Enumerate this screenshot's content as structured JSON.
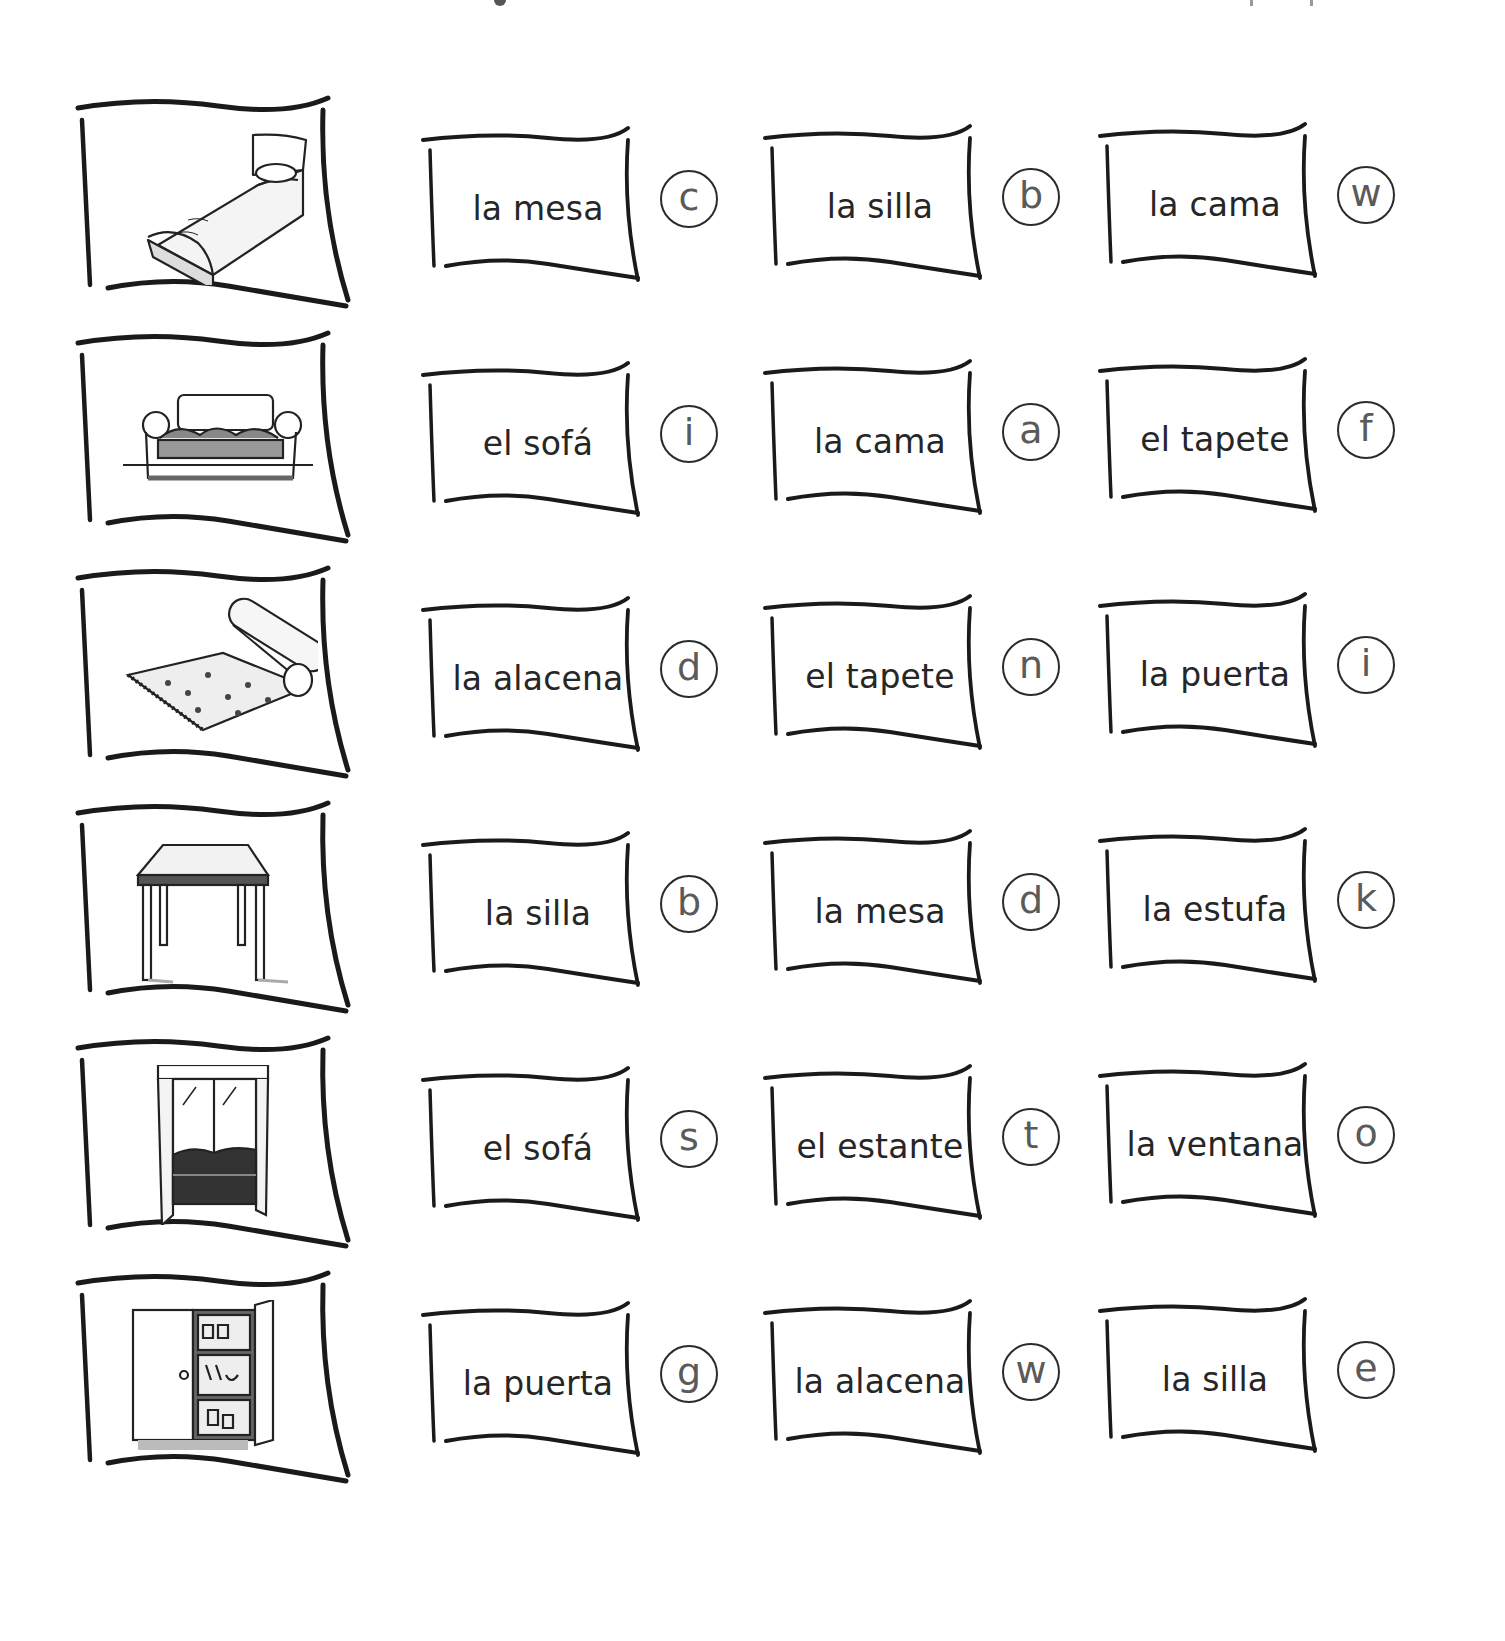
{
  "worksheet": {
    "rows": [
      {
        "picture": "bed-icon",
        "choices": [
          {
            "word": "la mesa",
            "letter": "c"
          },
          {
            "word": "la silla",
            "letter": "b"
          },
          {
            "word": "la cama",
            "letter": "w"
          }
        ]
      },
      {
        "picture": "sofa-icon",
        "choices": [
          {
            "word": "el sofá",
            "letter": "i"
          },
          {
            "word": "la cama",
            "letter": "a"
          },
          {
            "word": "el tapete",
            "letter": "f"
          }
        ]
      },
      {
        "picture": "rug-icon",
        "choices": [
          {
            "word": "la alacena",
            "letter": "d"
          },
          {
            "word": "el tapete",
            "letter": "n"
          },
          {
            "word": "la puerta",
            "letter": "i"
          }
        ]
      },
      {
        "picture": "table-icon",
        "choices": [
          {
            "word": "la silla",
            "letter": "b"
          },
          {
            "word": "la mesa",
            "letter": "d"
          },
          {
            "word": "la estufa",
            "letter": "k"
          }
        ]
      },
      {
        "picture": "window-icon",
        "choices": [
          {
            "word": "el sofá",
            "letter": "s"
          },
          {
            "word": "el estante",
            "letter": "t"
          },
          {
            "word": "la ventana",
            "letter": "o"
          }
        ]
      },
      {
        "picture": "cupboard-icon",
        "choices": [
          {
            "word": "la puerta",
            "letter": "g"
          },
          {
            "word": "la alacena",
            "letter": "w"
          },
          {
            "word": "la silla",
            "letter": "e"
          }
        ]
      }
    ]
  }
}
